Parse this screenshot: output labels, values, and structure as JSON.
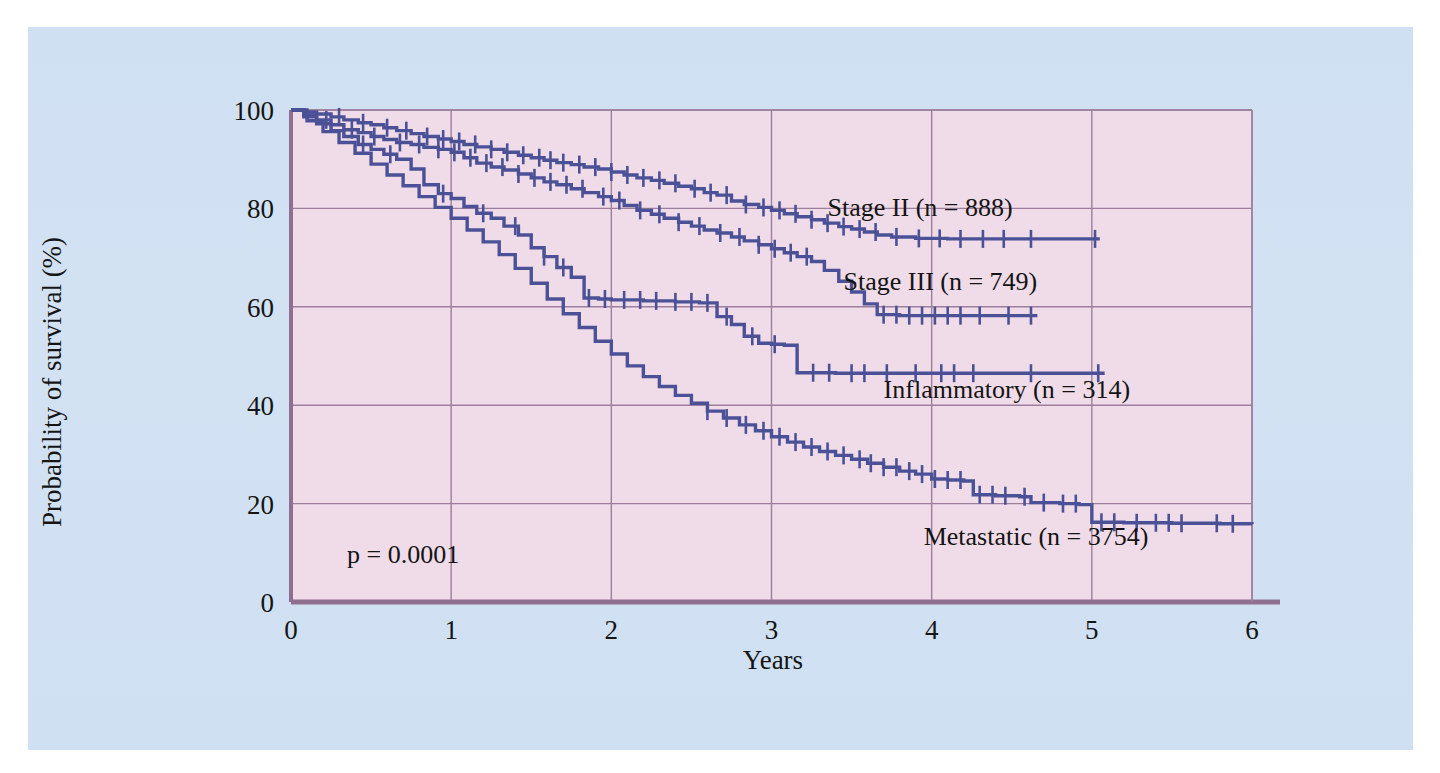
{
  "figure": {
    "background_color": "#cfe0f2",
    "plot_background_color": "#f0dbe8",
    "grid_color": "#9c7f9b",
    "axis_color": "#8f6f90",
    "curve_color": "#4b5196"
  },
  "chart_data": {
    "type": "line",
    "title": "",
    "subtitle": "",
    "xlabel": "Years",
    "ylabel": "Probability of survival (%)",
    "xlim": [
      0,
      6
    ],
    "ylim": [
      0,
      100
    ],
    "xticks": [
      "0",
      "1",
      "2",
      "3",
      "4",
      "5",
      "6"
    ],
    "yticks": [
      "0",
      "20",
      "40",
      "60",
      "80",
      "100"
    ],
    "grid": true,
    "legend_position": "inline-annotations",
    "annotations": [
      {
        "name": "p-value",
        "text": "p = 0.0001",
        "x": 0.35,
        "y": 8
      }
    ],
    "series": [
      {
        "name": "Stage II (n = 888)",
        "label": "Stage II (n = 888)",
        "n": 888,
        "label_x": 3.35,
        "label_y": 78.5,
        "color": "#4b5196",
        "points": [
          [
            0.0,
            100
          ],
          [
            0.08,
            99.6
          ],
          [
            0.16,
            99.2
          ],
          [
            0.25,
            98.6
          ],
          [
            0.33,
            98.0
          ],
          [
            0.42,
            97.4
          ],
          [
            0.5,
            97.0
          ],
          [
            0.58,
            96.4
          ],
          [
            0.66,
            95.8
          ],
          [
            0.75,
            95.2
          ],
          [
            0.83,
            94.6
          ],
          [
            0.92,
            94.1
          ],
          [
            1.0,
            93.6
          ],
          [
            1.08,
            93.0
          ],
          [
            1.16,
            92.5
          ],
          [
            1.25,
            92.0
          ],
          [
            1.33,
            91.4
          ],
          [
            1.42,
            90.8
          ],
          [
            1.5,
            90.3
          ],
          [
            1.58,
            89.8
          ],
          [
            1.66,
            89.3
          ],
          [
            1.75,
            88.9
          ],
          [
            1.83,
            88.4
          ],
          [
            1.92,
            88.0
          ],
          [
            2.0,
            87.4
          ],
          [
            2.08,
            86.8
          ],
          [
            2.16,
            86.2
          ],
          [
            2.25,
            85.7
          ],
          [
            2.33,
            85.1
          ],
          [
            2.42,
            84.5
          ],
          [
            2.5,
            84.0
          ],
          [
            2.58,
            83.2
          ],
          [
            2.66,
            82.7
          ],
          [
            2.75,
            81.5
          ],
          [
            2.83,
            80.8
          ],
          [
            2.92,
            80.2
          ],
          [
            3.0,
            79.6
          ],
          [
            3.08,
            78.9
          ],
          [
            3.16,
            78.3
          ],
          [
            3.25,
            77.7
          ],
          [
            3.33,
            77.0
          ],
          [
            3.42,
            76.3
          ],
          [
            3.5,
            75.8
          ],
          [
            3.58,
            75.2
          ],
          [
            3.66,
            74.6
          ],
          [
            3.75,
            74.2
          ],
          [
            3.9,
            73.9
          ],
          [
            4.1,
            73.8
          ],
          [
            4.6,
            73.8
          ],
          [
            5.05,
            73.8
          ]
        ],
        "censor_marks": [
          0.3,
          0.45,
          0.6,
          0.72,
          0.85,
          0.95,
          1.05,
          1.15,
          1.25,
          1.35,
          1.45,
          1.55,
          1.62,
          1.7,
          1.8,
          1.9,
          2.0,
          2.1,
          2.2,
          2.3,
          2.4,
          2.52,
          2.62,
          2.72,
          2.84,
          2.95,
          3.05,
          3.15,
          3.25,
          3.35,
          3.45,
          3.55,
          3.65,
          3.78,
          3.92,
          4.05,
          4.18,
          4.32,
          4.45,
          4.62,
          5.02
        ]
      },
      {
        "name": "Stage III (n = 749)",
        "label": "Stage III (n = 749)",
        "n": 749,
        "label_x": 3.45,
        "label_y": 63.5,
        "color": "#4b5196",
        "points": [
          [
            0.0,
            100
          ],
          [
            0.08,
            99.0
          ],
          [
            0.16,
            98.0
          ],
          [
            0.25,
            97.0
          ],
          [
            0.33,
            96.0
          ],
          [
            0.42,
            95.4
          ],
          [
            0.5,
            94.6
          ],
          [
            0.58,
            94.0
          ],
          [
            0.66,
            93.4
          ],
          [
            0.75,
            93.0
          ],
          [
            0.83,
            92.4
          ],
          [
            0.92,
            92.0
          ],
          [
            1.0,
            91.4
          ],
          [
            1.08,
            90.3
          ],
          [
            1.16,
            89.2
          ],
          [
            1.25,
            88.4
          ],
          [
            1.33,
            87.8
          ],
          [
            1.42,
            87.0
          ],
          [
            1.5,
            86.2
          ],
          [
            1.58,
            85.4
          ],
          [
            1.66,
            84.8
          ],
          [
            1.75,
            84.0
          ],
          [
            1.83,
            83.2
          ],
          [
            1.92,
            82.4
          ],
          [
            2.0,
            81.6
          ],
          [
            2.08,
            80.6
          ],
          [
            2.16,
            79.6
          ],
          [
            2.25,
            78.8
          ],
          [
            2.33,
            78.0
          ],
          [
            2.42,
            77.2
          ],
          [
            2.5,
            76.4
          ],
          [
            2.58,
            75.6
          ],
          [
            2.66,
            75.0
          ],
          [
            2.75,
            74.2
          ],
          [
            2.83,
            73.4
          ],
          [
            2.92,
            72.6
          ],
          [
            3.0,
            71.8
          ],
          [
            3.08,
            71.0
          ],
          [
            3.16,
            70.2
          ],
          [
            3.25,
            69.2
          ],
          [
            3.33,
            67.4
          ],
          [
            3.42,
            65.2
          ],
          [
            3.5,
            63.0
          ],
          [
            3.58,
            60.6
          ],
          [
            3.66,
            58.4
          ],
          [
            3.8,
            58.2
          ],
          [
            4.1,
            58.2
          ],
          [
            4.4,
            58.2
          ],
          [
            4.66,
            58.2
          ]
        ],
        "censor_marks": [
          0.22,
          0.38,
          0.52,
          0.68,
          0.8,
          0.92,
          1.02,
          1.12,
          1.22,
          1.32,
          1.42,
          1.52,
          1.62,
          1.72,
          1.82,
          1.95,
          2.05,
          2.18,
          2.3,
          2.42,
          2.55,
          2.68,
          2.8,
          2.92,
          3.02,
          3.12,
          3.22,
          3.7,
          3.78,
          3.86,
          3.94,
          4.02,
          4.1,
          4.18,
          4.3,
          4.48,
          4.62
        ]
      },
      {
        "name": "Inflammatory (n = 314)",
        "label": "Inflammatory (n = 314)",
        "n": 314,
        "label_x": 3.7,
        "label_y": 41.5,
        "color": "#4b5196",
        "points": [
          [
            0.0,
            100
          ],
          [
            0.08,
            98.6
          ],
          [
            0.16,
            97.2
          ],
          [
            0.25,
            95.8
          ],
          [
            0.33,
            94.6
          ],
          [
            0.42,
            93.0
          ],
          [
            0.5,
            92.0
          ],
          [
            0.58,
            91.0
          ],
          [
            0.66,
            90.0
          ],
          [
            0.75,
            88.0
          ],
          [
            0.83,
            84.8
          ],
          [
            0.92,
            83.0
          ],
          [
            1.0,
            82.0
          ],
          [
            1.08,
            80.4
          ],
          [
            1.16,
            79.0
          ],
          [
            1.25,
            78.0
          ],
          [
            1.33,
            76.4
          ],
          [
            1.42,
            74.6
          ],
          [
            1.5,
            72.0
          ],
          [
            1.58,
            70.2
          ],
          [
            1.66,
            68.0
          ],
          [
            1.75,
            66.0
          ],
          [
            1.83,
            61.8
          ],
          [
            1.92,
            61.6
          ],
          [
            2.0,
            61.4
          ],
          [
            2.2,
            61.2
          ],
          [
            2.4,
            61.0
          ],
          [
            2.55,
            60.8
          ],
          [
            2.66,
            58.0
          ],
          [
            2.75,
            56.4
          ],
          [
            2.83,
            54.0
          ],
          [
            2.92,
            52.6
          ],
          [
            3.0,
            52.4
          ],
          [
            3.08,
            52.2
          ],
          [
            3.16,
            46.6
          ],
          [
            3.4,
            46.5
          ],
          [
            3.8,
            46.5
          ],
          [
            4.3,
            46.5
          ],
          [
            4.7,
            46.5
          ],
          [
            5.08,
            46.5
          ]
        ],
        "censor_marks": [
          0.45,
          0.62,
          0.95,
          1.2,
          1.4,
          1.58,
          1.7,
          1.86,
          1.96,
          2.08,
          2.18,
          2.28,
          2.4,
          2.5,
          2.6,
          2.72,
          2.88,
          3.02,
          3.26,
          3.36,
          3.5,
          3.58,
          3.72,
          3.9,
          4.06,
          4.14,
          4.26,
          4.62,
          5.04
        ]
      },
      {
        "name": "Metastatic (n = 3754)",
        "label": "Metastatic (n = 3754)",
        "n": 3754,
        "label_x": 3.95,
        "label_y": 11.5,
        "color": "#4b5196",
        "points": [
          [
            0.0,
            100
          ],
          [
            0.1,
            97.8
          ],
          [
            0.2,
            95.6
          ],
          [
            0.3,
            93.4
          ],
          [
            0.4,
            91.2
          ],
          [
            0.5,
            89.0
          ],
          [
            0.6,
            86.8
          ],
          [
            0.7,
            84.6
          ],
          [
            0.8,
            82.4
          ],
          [
            0.9,
            80.2
          ],
          [
            1.0,
            78.0
          ],
          [
            1.1,
            75.6
          ],
          [
            1.2,
            73.2
          ],
          [
            1.3,
            70.6
          ],
          [
            1.4,
            67.8
          ],
          [
            1.5,
            64.8
          ],
          [
            1.6,
            61.6
          ],
          [
            1.7,
            58.6
          ],
          [
            1.8,
            55.8
          ],
          [
            1.9,
            53.0
          ],
          [
            2.0,
            50.4
          ],
          [
            2.1,
            48.0
          ],
          [
            2.2,
            45.8
          ],
          [
            2.3,
            43.8
          ],
          [
            2.4,
            42.0
          ],
          [
            2.5,
            40.4
          ],
          [
            2.6,
            38.8
          ],
          [
            2.7,
            37.4
          ],
          [
            2.8,
            36.0
          ],
          [
            2.9,
            34.8
          ],
          [
            3.0,
            33.6
          ],
          [
            3.1,
            32.5
          ],
          [
            3.2,
            31.5
          ],
          [
            3.3,
            30.6
          ],
          [
            3.4,
            29.8
          ],
          [
            3.5,
            29.0
          ],
          [
            3.6,
            28.2
          ],
          [
            3.7,
            27.4
          ],
          [
            3.8,
            26.6
          ],
          [
            3.9,
            26.0
          ],
          [
            4.0,
            25.0
          ],
          [
            4.1,
            24.8
          ],
          [
            4.2,
            24.6
          ],
          [
            4.26,
            21.8
          ],
          [
            4.4,
            21.6
          ],
          [
            4.55,
            21.4
          ],
          [
            4.62,
            20.2
          ],
          [
            4.8,
            20.0
          ],
          [
            4.92,
            19.8
          ],
          [
            5.0,
            16.2
          ],
          [
            5.2,
            16.1
          ],
          [
            5.5,
            16.0
          ],
          [
            5.8,
            15.9
          ],
          [
            6.0,
            15.8
          ]
        ],
        "censor_marks": [
          2.6,
          2.72,
          2.84,
          2.95,
          3.05,
          3.15,
          3.25,
          3.35,
          3.45,
          3.55,
          3.62,
          3.7,
          3.78,
          3.86,
          3.94,
          4.02,
          4.1,
          4.18,
          4.3,
          4.38,
          4.46,
          4.58,
          4.7,
          4.82,
          4.9,
          5.06,
          5.14,
          5.28,
          5.4,
          5.48,
          5.56,
          5.78,
          5.88
        ]
      }
    ]
  }
}
